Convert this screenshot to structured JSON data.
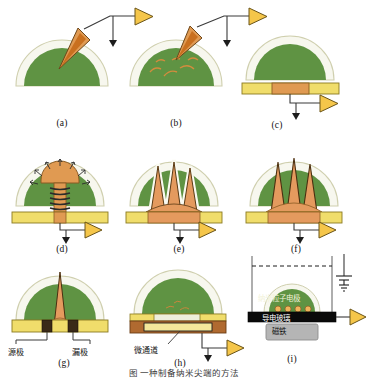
{
  "figure": {
    "caption": "图    一种制备纳米尖端的方法",
    "colors": {
      "dome_fill": "#5f9343",
      "dome_outline": "#f2f2e4",
      "dome_stroke": "#cfcfae",
      "substrate_yellow": "#f0dd6b",
      "substrate_yellow_dark": "#e3c93f",
      "electrode_orange": "#e09a52",
      "tip_orange": "#e49a5e",
      "tip_orange_dark": "#c06a2a",
      "amplifier_fill": "#f5c64a",
      "amplifier_stroke": "#5a4a1c",
      "wire": "#3a3a3a",
      "contact_black": "#2b2620",
      "glass_black": "#0a0a0a",
      "magnet_gray": "#b5b5b5",
      "channel_brown": "#b06a30"
    }
  },
  "panels": [
    {
      "id": "a",
      "label": "(a)",
      "desc": "pipette-tip-inserted-into-dome"
    },
    {
      "id": "b",
      "label": "(b)",
      "desc": "dispersion-inside-dome"
    },
    {
      "id": "c",
      "label": "(c)",
      "desc": "dome-on-electrode-substrate"
    },
    {
      "id": "d",
      "label": "(d)",
      "desc": "mushroom-growth-with-coil"
    },
    {
      "id": "e",
      "label": "(e)",
      "desc": "three-spikes-outlined"
    },
    {
      "id": "f",
      "label": "(f)",
      "desc": "three-spikes-bare"
    },
    {
      "id": "g",
      "label": "(g)",
      "desc": "single-tip-source-drain"
    },
    {
      "id": "h",
      "label": "(h)",
      "desc": "microchannel-device"
    },
    {
      "id": "i",
      "label": "(i)",
      "desc": "electrodeposition-cell-with-magnet"
    }
  ],
  "annotations": {
    "source_electrode": "源极",
    "drain_electrode": "漏极",
    "microchannel": "微通道",
    "nanoparticle_electrode": "纳米粒子电极",
    "conductive_glass": "导电玻璃",
    "magnet": "磁铁"
  }
}
